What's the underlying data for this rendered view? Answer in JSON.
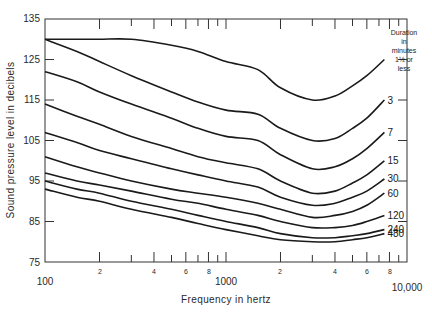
{
  "chart_data": {
    "type": "line",
    "title": "",
    "xlabel": "Frequency in hertz",
    "ylabel": "Sound pressure level in decibels",
    "x_scale": "log",
    "xlim": [
      100,
      10000
    ],
    "ylim": [
      75,
      135
    ],
    "grid": false,
    "y_ticks": [
      75,
      85,
      95,
      105,
      115,
      125,
      135
    ],
    "x_major_tick_labels": [
      "100",
      "1000",
      "10,000"
    ],
    "x_minor_tick_labels": [
      "2",
      "4",
      "6",
      "8",
      "2",
      "4",
      "6",
      "8"
    ],
    "x_minor_tick_values": [
      200,
      400,
      600,
      800,
      2000,
      4000,
      6000,
      8000
    ],
    "legend_title": [
      "Duration",
      "in",
      "minutes"
    ],
    "x": [
      100,
      150,
      200,
      300,
      500,
      700,
      1000,
      1500,
      2000,
      3000,
      4000,
      5000,
      6000,
      7500
    ],
    "series": [
      {
        "name": "1½ or less",
        "label": [
          "1½ or",
          "less"
        ],
        "values": [
          130,
          130,
          130,
          130,
          128.5,
          127,
          124.5,
          122.5,
          118,
          115,
          116,
          118.5,
          121,
          125
        ]
      },
      {
        "name": "3",
        "label": [
          "3"
        ],
        "values": [
          130,
          127,
          124.5,
          121,
          117,
          114.5,
          112.5,
          111.5,
          108,
          105,
          105.5,
          108,
          110.5,
          115
        ]
      },
      {
        "name": "7",
        "label": [
          "7"
        ],
        "values": [
          122,
          119.5,
          117,
          114,
          110.5,
          108,
          106,
          105,
          101.5,
          98,
          98.5,
          100.5,
          103,
          107
        ]
      },
      {
        "name": "15",
        "label": [
          "15"
        ],
        "values": [
          114,
          111,
          109,
          106,
          103,
          101,
          99.5,
          98,
          95,
          92,
          92.5,
          94.5,
          96.5,
          100
        ]
      },
      {
        "name": "30",
        "label": [
          "30"
        ],
        "values": [
          107,
          104.5,
          102.5,
          100.5,
          98,
          96.5,
          95,
          93.5,
          91,
          89,
          89.5,
          91,
          92.5,
          95.5
        ]
      },
      {
        "name": "60",
        "label": [
          "60"
        ],
        "values": [
          101,
          98.5,
          97,
          95,
          93,
          92,
          91,
          89.5,
          88,
          86,
          86.5,
          87.5,
          89,
          92
        ]
      },
      {
        "name": "120",
        "label": [
          "120"
        ],
        "values": [
          97,
          95,
          94,
          92.5,
          90.5,
          89.5,
          88,
          86.5,
          85,
          83.5,
          83.5,
          84,
          85,
          86.5
        ]
      },
      {
        "name": "240",
        "label": [
          "240"
        ],
        "values": [
          95,
          93,
          92,
          90,
          88,
          86.5,
          85,
          83.5,
          82,
          81,
          81,
          81.5,
          82,
          83
        ]
      },
      {
        "name": "480",
        "label": [
          "480"
        ],
        "values": [
          93,
          91,
          90,
          88,
          86,
          84.5,
          83,
          81.5,
          80.5,
          80,
          80,
          80.5,
          81,
          82
        ]
      }
    ]
  },
  "axes": {
    "y_tick_labels": [
      "75",
      "85",
      "95",
      "105",
      "115",
      "125",
      "135"
    ],
    "x_label_100": "100",
    "x_label_1000": "1000",
    "x_label_10000": "10,000",
    "x_title": "Frequency in hertz",
    "y_title": "Sound pressure level in decibels"
  },
  "legend": {
    "line1": "Duration",
    "line2": "in",
    "line3": "minutes"
  },
  "colors": {
    "line": "#1a1a1a",
    "axis": "#333333",
    "text": "#2a2a2a",
    "background": "#ffffff"
  }
}
